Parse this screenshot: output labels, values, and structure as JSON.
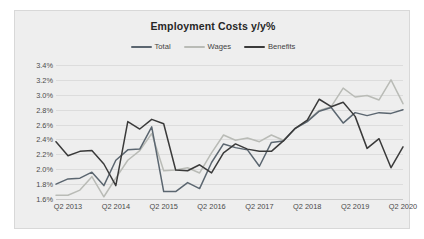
{
  "chart_data": {
    "type": "line",
    "title": "Employment Costs y/y%",
    "xlabel": "",
    "ylabel": "",
    "ylim": [
      1.6,
      3.4
    ],
    "ytick_step": 0.2,
    "ytick_labels": [
      "3.4%",
      "3.2%",
      "3.0%",
      "2.8%",
      "2.6%",
      "2.4%",
      "2.2%",
      "2.0%",
      "1.8%",
      "1.6%"
    ],
    "ytick_values": [
      3.4,
      3.2,
      3.0,
      2.8,
      2.6,
      2.4,
      2.2,
      2.0,
      1.8,
      1.6
    ],
    "grid": true,
    "legend_position": "top-center",
    "xtick_labels": [
      "Q2 2013",
      "Q2 2014",
      "Q2 2015",
      "Q2 2016",
      "Q2 2017",
      "Q2 2018",
      "Q2 2019",
      "Q2 2020"
    ],
    "x_index_of_ticks": [
      1,
      5,
      9,
      13,
      17,
      21,
      25,
      29
    ],
    "n_points": 30,
    "series": [
      {
        "name": "Total",
        "color": "#5b6670",
        "values": [
          1.8,
          1.87,
          1.88,
          1.96,
          1.78,
          2.12,
          2.26,
          2.27,
          2.57,
          1.7,
          1.7,
          1.82,
          1.74,
          2.09,
          2.34,
          2.29,
          2.26,
          2.04,
          2.36,
          2.38,
          2.55,
          2.64,
          2.78,
          2.83,
          2.62,
          2.76,
          2.72,
          2.76,
          2.75,
          2.8
        ]
      },
      {
        "name": "Wages",
        "color": "#b9bbb6",
        "values": [
          1.65,
          1.65,
          1.72,
          1.9,
          1.63,
          1.88,
          2.12,
          2.25,
          2.48,
          1.98,
          1.99,
          2.02,
          1.95,
          2.22,
          2.46,
          2.39,
          2.42,
          2.37,
          2.46,
          2.39,
          2.55,
          2.65,
          2.79,
          2.84,
          3.09,
          2.97,
          2.99,
          2.93,
          3.2,
          2.88
        ]
      },
      {
        "name": "Benefits",
        "color": "#3a3a3a",
        "values": [
          2.37,
          2.18,
          2.24,
          2.25,
          2.07,
          1.78,
          2.64,
          2.54,
          2.67,
          2.61,
          1.99,
          1.98,
          2.06,
          1.95,
          2.22,
          2.34,
          2.27,
          2.24,
          2.24,
          2.38,
          2.55,
          2.66,
          2.94,
          2.84,
          2.9,
          2.71,
          2.28,
          2.41,
          2.02,
          2.3
        ]
      }
    ]
  }
}
